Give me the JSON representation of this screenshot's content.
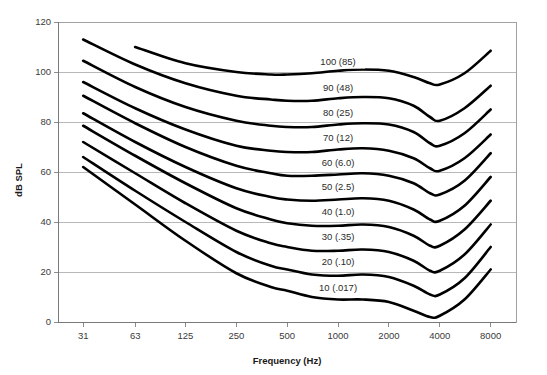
{
  "chart_data": {
    "type": "line",
    "title": "",
    "xlabel": "Frequency (Hz)",
    "ylabel": "dB SPL",
    "xscale": "log",
    "xlim": [
      22,
      11300
    ],
    "ylim": [
      0,
      120
    ],
    "grid": true,
    "legend_position": "inline-labels",
    "xticks": [
      31,
      63,
      125,
      250,
      500,
      1000,
      2000,
      4000,
      8000
    ],
    "xtick_labels": [
      "31",
      "63",
      "125",
      "250",
      "500",
      "1000",
      "2000",
      "4000",
      "8000"
    ],
    "yticks": [
      0,
      20,
      40,
      60,
      80,
      100,
      120
    ],
    "ytick_labels": [
      "0",
      "20",
      "40",
      "60",
      "80",
      "100",
      "120"
    ],
    "x": [
      31,
      63,
      125,
      250,
      400,
      500,
      700,
      1000,
      1400,
      2000,
      2800,
      3500,
      4000,
      5600,
      8000
    ],
    "series": [
      {
        "name": "100 (85)",
        "label": "100 (85)",
        "label_phon": 100,
        "label_sone": 85,
        "label_x": 1000,
        "label_y": 103,
        "values": [
          null,
          110.0,
          103.5,
          100.0,
          99.0,
          99.0,
          99.5,
          100.5,
          101.0,
          100.5,
          98.0,
          95.5,
          95.0,
          99.5,
          108.5
        ]
      },
      {
        "name": "90 (48)",
        "label": "90 (48)",
        "label_phon": 90,
        "label_sone": 48,
        "label_x": 1000,
        "label_y": 92.5,
        "values": [
          113.0,
          103.0,
          95.5,
          90.5,
          89.0,
          88.5,
          88.5,
          89.5,
          90.0,
          89.5,
          86.5,
          82.0,
          80.5,
          85.5,
          94.5
        ]
      },
      {
        "name": "80 (25)",
        "label": "80 (25)",
        "label_phon": 80,
        "label_sone": 25,
        "label_x": 1000,
        "label_y": 82.5,
        "values": [
          104.5,
          94.0,
          86.0,
          80.5,
          78.5,
          78.0,
          78.0,
          79.0,
          79.5,
          79.0,
          76.0,
          71.5,
          70.5,
          75.5,
          85.0
        ]
      },
      {
        "name": "70 (12)",
        "label": "70 (12)",
        "label_phon": 70,
        "label_sone": 12,
        "label_x": 1000,
        "label_y": 72.5,
        "values": [
          96.0,
          85.5,
          77.0,
          70.5,
          68.5,
          68.0,
          68.0,
          69.0,
          69.5,
          68.5,
          65.5,
          61.5,
          60.5,
          65.5,
          75.0
        ]
      },
      {
        "name": "60 (6.0)",
        "label": "60 (6.0)",
        "label_phon": 60,
        "label_sone": 6.0,
        "label_x": 1000,
        "label_y": 62.5,
        "values": [
          90.5,
          79.5,
          70.0,
          62.5,
          59.5,
          58.5,
          58.5,
          59.0,
          59.5,
          58.5,
          55.5,
          51.5,
          51.0,
          56.5,
          67.5
        ]
      },
      {
        "name": "50 (2.5)",
        "label": "50 (2.5)",
        "label_phon": 50,
        "label_sone": 2.5,
        "label_x": 1000,
        "label_y": 53,
        "values": [
          83.5,
          72.0,
          62.0,
          53.5,
          50.0,
          49.0,
          48.5,
          49.0,
          49.5,
          48.5,
          45.0,
          41.0,
          40.5,
          46.5,
          58.0
        ]
      },
      {
        "name": "40 (1.0)",
        "label": "40 (1.0)",
        "label_phon": 40,
        "label_sone": 1.0,
        "label_x": 1000,
        "label_y": 43,
        "values": [
          78.5,
          66.5,
          55.5,
          45.5,
          41.0,
          39.5,
          38.5,
          38.5,
          39.0,
          38.0,
          34.5,
          30.5,
          30.5,
          37.0,
          48.5
        ]
      },
      {
        "name": "30 (.35)",
        "label": "30 (.35)",
        "label_phon": 30,
        "label_sone": 0.35,
        "label_x": 1000,
        "label_y": 33,
        "values": [
          72.0,
          59.5,
          47.5,
          36.5,
          31.5,
          30.0,
          28.5,
          28.5,
          29.0,
          28.0,
          24.5,
          20.5,
          20.5,
          27.0,
          39.0
        ]
      },
      {
        "name": "20 (.10)",
        "label": "20 (.10)",
        "label_phon": 20,
        "label_sone": 0.1,
        "label_x": 1000,
        "label_y": 23,
        "values": [
          66.0,
          52.5,
          40.0,
          28.0,
          22.5,
          21.0,
          19.0,
          18.5,
          19.0,
          18.0,
          14.5,
          11.0,
          11.0,
          17.5,
          30.0
        ]
      },
      {
        "name": "10 (.017)",
        "label": "10 (.017)",
        "label_phon": 10,
        "label_sone": 0.017,
        "label_x": 1000,
        "label_y": 12.5,
        "values": [
          62.0,
          47.0,
          32.5,
          19.5,
          14.0,
          12.5,
          10.0,
          9.0,
          9.0,
          8.0,
          4.5,
          2.0,
          2.5,
          9.0,
          21.0
        ]
      }
    ]
  },
  "colors": {
    "curve": "#000000",
    "grid": "#9a9a9a",
    "axis": "#6f6f6f",
    "tick_text": "#3a3a3a",
    "title_text": "#1a1a1a",
    "background": "#ffffff"
  }
}
